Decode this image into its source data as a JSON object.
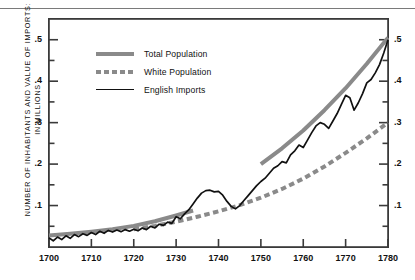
{
  "figure": {
    "y_axis_title": "NUMBER OF INHABITANTS AND VALUE OF IMPORTS:\nIN MILLIONS",
    "top_rule": "horizontal-rule"
  },
  "legend": {
    "items": [
      {
        "label": "Total Population",
        "style": "solid-thick-gray",
        "color": "#8a8a8a",
        "swatch": "total-population-swatch"
      },
      {
        "label": "White Population",
        "style": "dashed-thick-gray",
        "color": "#8a8a8a",
        "swatch": "white-population-swatch"
      },
      {
        "label": "English Imports",
        "style": "solid-thin-black",
        "color": "#111111",
        "swatch": "english-imports-swatch"
      }
    ]
  },
  "chart_data": {
    "type": "line",
    "title": "",
    "subtitle": "",
    "xlabel": "",
    "ylabel": "NUMBER OF INHABITANTS AND VALUE OF IMPORTS: IN MILLIONS",
    "xlim": [
      1700,
      1780
    ],
    "ylim": [
      0,
      0.55
    ],
    "grid": false,
    "legend_position": "upper-left-inside",
    "x_ticks": [
      1700,
      1710,
      1720,
      1730,
      1740,
      1750,
      1760,
      1770,
      1780
    ],
    "x_tick_labels": [
      "1700",
      "1710",
      "1720",
      "1730",
      "1740",
      "1750",
      "1760",
      "1770",
      "1780"
    ],
    "y_ticks_major": [
      0.1,
      0.2,
      0.3,
      0.4,
      0.5
    ],
    "y_tick_labels": [
      ".1",
      ".2",
      ".3",
      ".4",
      ".5"
    ],
    "y_ticks_minor": [
      0.05,
      0.15,
      0.25,
      0.35,
      0.45
    ],
    "right_axis_mirrors_left": true,
    "series": [
      {
        "name": "Total Population",
        "color": "#8a8a8a",
        "style": "solid",
        "width": 4,
        "segments": [
          {
            "x": [
              1700,
              1705,
              1710,
              1715,
              1720,
              1725,
              1730,
              1734
            ],
            "values": [
              0.028,
              0.032,
              0.037,
              0.043,
              0.051,
              0.062,
              0.076,
              0.088
            ]
          },
          {
            "x": [
              1750,
              1755,
              1760,
              1765,
              1770,
              1775,
              1780
            ],
            "values": [
              0.2,
              0.238,
              0.281,
              0.33,
              0.383,
              0.442,
              0.505
            ]
          }
        ]
      },
      {
        "name": "White Population",
        "color": "#8a8a8a",
        "style": "dashed",
        "width": 4,
        "x": [
          1720,
          1725,
          1730,
          1735,
          1740,
          1745,
          1750,
          1755,
          1760,
          1765,
          1770,
          1775,
          1780
        ],
        "values": [
          0.043,
          0.051,
          0.061,
          0.073,
          0.086,
          0.101,
          0.119,
          0.14,
          0.165,
          0.194,
          0.227,
          0.262,
          0.3
        ]
      },
      {
        "name": "English Imports",
        "color": "#111111",
        "style": "solid",
        "width": 1.7,
        "x": [
          1700,
          1701,
          1702,
          1703,
          1704,
          1705,
          1706,
          1707,
          1708,
          1709,
          1710,
          1711,
          1712,
          1713,
          1714,
          1715,
          1716,
          1717,
          1718,
          1719,
          1720,
          1721,
          1722,
          1723,
          1724,
          1725,
          1726,
          1727,
          1728,
          1729,
          1730,
          1731,
          1732,
          1733,
          1734,
          1735,
          1736,
          1737,
          1738,
          1739,
          1740,
          1741,
          1742,
          1743,
          1744,
          1745,
          1746,
          1747,
          1748,
          1749,
          1750,
          1751,
          1752,
          1753,
          1754,
          1755,
          1756,
          1757,
          1758,
          1759,
          1760,
          1761,
          1762,
          1763,
          1764,
          1765,
          1766,
          1767,
          1768,
          1769,
          1770,
          1771,
          1772,
          1773,
          1774,
          1775,
          1776,
          1777,
          1778,
          1779,
          1780
        ],
        "values": [
          0.022,
          0.015,
          0.024,
          0.018,
          0.027,
          0.021,
          0.03,
          0.025,
          0.032,
          0.028,
          0.035,
          0.03,
          0.038,
          0.033,
          0.04,
          0.036,
          0.041,
          0.037,
          0.042,
          0.038,
          0.043,
          0.039,
          0.046,
          0.042,
          0.05,
          0.046,
          0.055,
          0.052,
          0.06,
          0.057,
          0.073,
          0.068,
          0.08,
          0.09,
          0.104,
          0.118,
          0.13,
          0.136,
          0.137,
          0.133,
          0.134,
          0.125,
          0.11,
          0.098,
          0.092,
          0.1,
          0.112,
          0.124,
          0.136,
          0.148,
          0.158,
          0.166,
          0.178,
          0.19,
          0.196,
          0.206,
          0.203,
          0.222,
          0.232,
          0.246,
          0.24,
          0.258,
          0.276,
          0.292,
          0.3,
          0.296,
          0.286,
          0.304,
          0.322,
          0.344,
          0.366,
          0.36,
          0.33,
          0.348,
          0.37,
          0.396,
          0.404,
          0.42,
          0.44,
          0.468,
          0.5
        ]
      }
    ]
  }
}
